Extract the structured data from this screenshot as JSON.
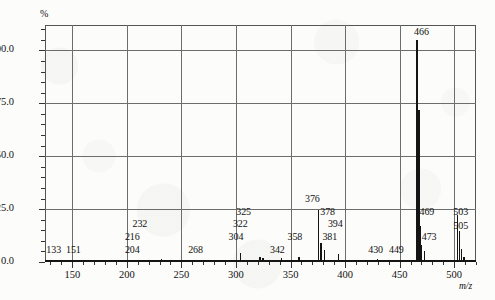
{
  "figure": {
    "y_axis_title": "%",
    "x_axis_title": "m/z"
  },
  "chart_data": {
    "type": "bar",
    "title": "",
    "subtitle": "",
    "xlabel": "m/z",
    "ylabel": "%",
    "xlim": [
      125,
      520
    ],
    "ylim": [
      0,
      112
    ],
    "grid": true,
    "legend": null,
    "x_ticks_major": [
      150,
      200,
      250,
      300,
      350,
      400,
      450,
      500
    ],
    "x_tick_labels": [
      "150",
      "200",
      "250",
      "300",
      "350",
      "400",
      "450",
      "500"
    ],
    "x_tick_minor_step": 10,
    "y_ticks_major": [
      0.0,
      25.0,
      50.0,
      75.0,
      100.0
    ],
    "y_tick_labels": [
      "0.0",
      "25.0",
      "50.0",
      "75.0",
      "100.0"
    ],
    "y_tick_minor_step": 5,
    "peaks": [
      {
        "mz": 133,
        "intensity": 0.6,
        "label": "133"
      },
      {
        "mz": 151,
        "intensity": 0.6,
        "label": "151"
      },
      {
        "mz": 204,
        "intensity": 0.8,
        "label": "204"
      },
      {
        "mz": 216,
        "intensity": 0.8,
        "label": "216"
      },
      {
        "mz": 232,
        "intensity": 1.6,
        "label": "232"
      },
      {
        "mz": 268,
        "intensity": 0.7,
        "label": "268"
      },
      {
        "mz": 304,
        "intensity": 4.2,
        "label": "304"
      },
      {
        "mz": 322,
        "intensity": 2.2,
        "label": "322"
      },
      {
        "mz": 325,
        "intensity": 2.0,
        "label": "325"
      },
      {
        "mz": 342,
        "intensity": 1.7,
        "label": "342"
      },
      {
        "mz": 358,
        "intensity": 2.4,
        "label": "358"
      },
      {
        "mz": 376,
        "intensity": 24.5,
        "label": "376"
      },
      {
        "mz": 378,
        "intensity": 9.0,
        "label": "378"
      },
      {
        "mz": 381,
        "intensity": 5.5,
        "label": "381"
      },
      {
        "mz": 394,
        "intensity": 4.0,
        "label": "394"
      },
      {
        "mz": 430,
        "intensity": 1.2,
        "label": "430"
      },
      {
        "mz": 449,
        "intensity": 0.9,
        "label": "449"
      },
      {
        "mz": 466,
        "intensity": 105.0,
        "label": "466"
      },
      {
        "mz": 468,
        "intensity": 72.0,
        "label": ""
      },
      {
        "mz": 469,
        "intensity": 17.0,
        "label": "469"
      },
      {
        "mz": 470,
        "intensity": 8.0,
        "label": ""
      },
      {
        "mz": 473,
        "intensity": 5.0,
        "label": "473"
      },
      {
        "mz": 503,
        "intensity": 22.0,
        "label": "503"
      },
      {
        "mz": 505,
        "intensity": 14.5,
        "label": "505"
      },
      {
        "mz": 507,
        "intensity": 6.0,
        "label": ""
      },
      {
        "mz": 509,
        "intensity": 2.5,
        "label": ""
      }
    ],
    "peak_labels": [
      {
        "text": "133",
        "mz": 133,
        "y": 3.5
      },
      {
        "text": "151",
        "mz": 151,
        "y": 3.5
      },
      {
        "text": "204",
        "mz": 205,
        "y": 3.5
      },
      {
        "text": "216",
        "mz": 205,
        "y": 9.5
      },
      {
        "text": "232",
        "mz": 212,
        "y": 15.5
      },
      {
        "text": "268",
        "mz": 263,
        "y": 3.5
      },
      {
        "text": "304",
        "mz": 300,
        "y": 9.5
      },
      {
        "text": "322",
        "mz": 304,
        "y": 15.5
      },
      {
        "text": "325",
        "mz": 307,
        "y": 21.5
      },
      {
        "text": "342",
        "mz": 338,
        "y": 3.5
      },
      {
        "text": "358",
        "mz": 354,
        "y": 9.5
      },
      {
        "text": "376",
        "mz": 370,
        "y": 27.5
      },
      {
        "text": "378",
        "mz": 384,
        "y": 21.5
      },
      {
        "text": "394",
        "mz": 391,
        "y": 15.5
      },
      {
        "text": "381",
        "mz": 386,
        "y": 9.5
      },
      {
        "text": "430",
        "mz": 428,
        "y": 3.5
      },
      {
        "text": "449",
        "mz": 447,
        "y": 3.5
      },
      {
        "text": "466",
        "mz": 470,
        "y": 106.5
      },
      {
        "text": "469",
        "mz": 475,
        "y": 21.5
      },
      {
        "text": "473",
        "mz": 477,
        "y": 9.5
      },
      {
        "text": "503",
        "mz": 506,
        "y": 21.5
      },
      {
        "text": "505",
        "mz": 506,
        "y": 14.5
      }
    ]
  }
}
